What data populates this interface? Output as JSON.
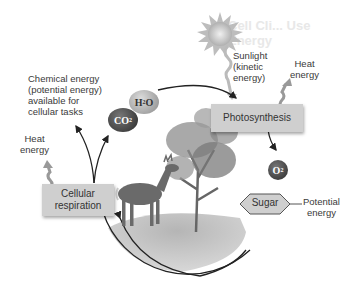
{
  "background_ghost_text": "Cell Cli... Use Energy",
  "sun": {
    "label_lines": [
      "Sunlight",
      "(kinetic",
      "energy)"
    ]
  },
  "photosynthesis": {
    "box_label": "Photosynthesis",
    "heat_label_lines": [
      "Heat",
      "energy"
    ]
  },
  "cellular_respiration": {
    "box_label_lines": [
      "Cellular",
      "respiration"
    ],
    "heat_label_lines": [
      "Heat",
      "energy"
    ]
  },
  "chemical_energy": {
    "label_lines": [
      "Chemical energy",
      "(potential energy)",
      "available for",
      "cellular tasks"
    ]
  },
  "molecules": {
    "water": {
      "symbol": "H",
      "sub": "2",
      "suffix": "O"
    },
    "carbon_dioxide": {
      "symbol": "CO",
      "sub": "2"
    },
    "oxygen": {
      "symbol": "O",
      "sub": "2"
    }
  },
  "sugar": {
    "label": "Sugar",
    "annotation_lines": [
      "Potential",
      "energy"
    ]
  },
  "colors": {
    "box_fill": "#cfcfcf",
    "text": "#3a3a3a",
    "arrow": "#222222",
    "molecule_dark": "#3c3c3c",
    "molecule_light": "#9a9a9a",
    "sun": "#c8c8c8"
  }
}
